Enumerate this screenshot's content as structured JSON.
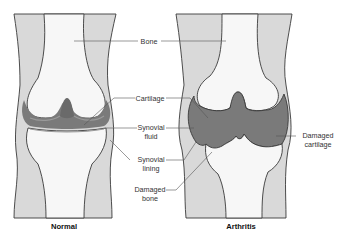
{
  "diagram": {
    "panels": [
      {
        "id": "normal",
        "caption": "Normal"
      },
      {
        "id": "arthritis",
        "caption": "Arthritis"
      }
    ],
    "labels": {
      "bone": "Bone",
      "cartilage": "Cartilage",
      "synovial_fluid_line1": "Synovial",
      "synovial_fluid_line2": "fluid",
      "synovial_lining_line1": "Synovial",
      "synovial_lining_line2": "lining",
      "damaged_bone_line1": "Damaged",
      "damaged_bone_line2": "bone",
      "damaged_cartilage_line1": "Damaged",
      "damaged_cartilage_line2": "cartilage"
    },
    "colors": {
      "soft_tissue": "#d9d9d9",
      "bone": "#f7f7f7",
      "joint_fluid": "#7a7a7a",
      "cartilage": "#a9a9a9",
      "outline": "#3a3a3a"
    }
  }
}
